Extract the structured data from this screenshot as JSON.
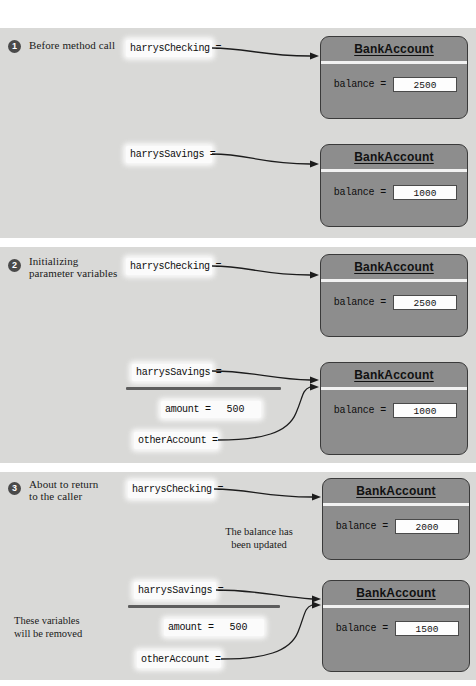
{
  "figure": {
    "type": "object-reference-diagram",
    "background": "#ffffff",
    "panel_background": "#d9d9d7",
    "object_fill": "#8d8d8d",
    "object_border": "#3a3a3a",
    "value_box_fill": "#fdfdfd"
  },
  "panels": [
    {
      "step": "1",
      "caption_lines": [
        "Before method call"
      ],
      "variables": [
        {
          "name": "harrysChecking =",
          "value": ""
        },
        {
          "name": "harrysSavings =",
          "value": ""
        }
      ],
      "objects": [
        {
          "title": "BankAccount",
          "field_name": "balance =",
          "field_value": "2500"
        },
        {
          "title": "BankAccount",
          "field_name": "balance =",
          "field_value": "1000"
        }
      ],
      "notes": [],
      "divider": false
    },
    {
      "step": "2",
      "caption_lines": [
        "Initializing",
        "parameter variables"
      ],
      "variables": [
        {
          "name": "harrysChecking =",
          "value": ""
        },
        {
          "name": "harrysSavings =",
          "value": ""
        },
        {
          "name": "amount =",
          "value": "500"
        },
        {
          "name": "otherAccount =",
          "value": ""
        }
      ],
      "objects": [
        {
          "title": "BankAccount",
          "field_name": "balance =",
          "field_value": "2500"
        },
        {
          "title": "BankAccount",
          "field_name": "balance =",
          "field_value": "1000"
        }
      ],
      "notes": [],
      "divider": true
    },
    {
      "step": "3",
      "caption_lines": [
        "About to return",
        "to the caller"
      ],
      "variables": [
        {
          "name": "harrysChecking =",
          "value": ""
        },
        {
          "name": "harrysSavings =",
          "value": ""
        },
        {
          "name": "amount =",
          "value": "500"
        },
        {
          "name": "otherAccount =",
          "value": ""
        }
      ],
      "objects": [
        {
          "title": "BankAccount",
          "field_name": "balance =",
          "field_value": "2000"
        },
        {
          "title": "BankAccount",
          "field_name": "balance =",
          "field_value": "1500"
        }
      ],
      "notes": [
        {
          "id": "balance-updated",
          "lines": [
            "The balance has",
            "been updated"
          ]
        },
        {
          "id": "vars-removed",
          "lines": [
            "These variables",
            "will be removed"
          ]
        }
      ],
      "divider": true
    }
  ]
}
